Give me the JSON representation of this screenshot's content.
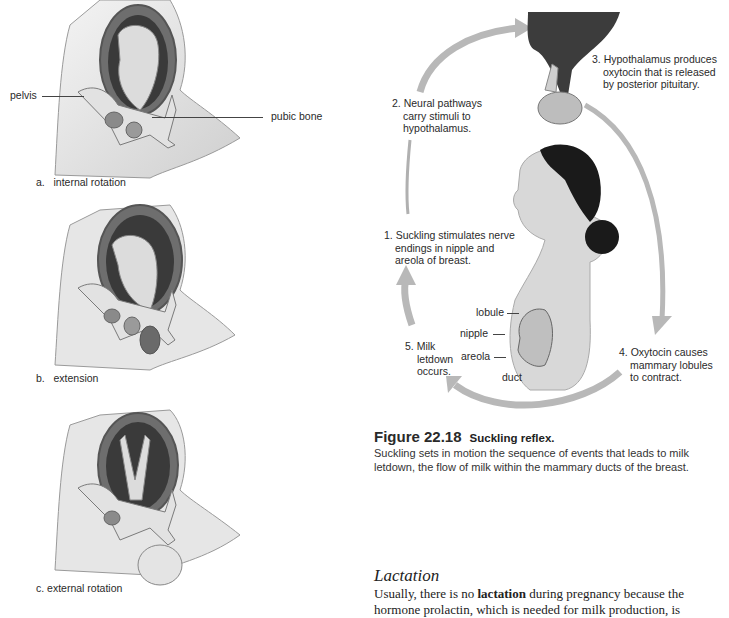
{
  "left_figure": {
    "panels": [
      {
        "id": "a",
        "caption": "a.   internal rotation",
        "labels": {
          "pelvis": "pelvis",
          "pubic_bone": "pubic bone"
        }
      },
      {
        "id": "b",
        "caption": "b.   extension"
      },
      {
        "id": "c",
        "caption": "c. external rotation"
      }
    ]
  },
  "suckling_diagram": {
    "steps": [
      {
        "num": "1.",
        "text": [
          "Suckling stimulates nerve",
          "endings in nipple and",
          "areola of breast."
        ]
      },
      {
        "num": "2.",
        "text": [
          "Neural pathways",
          "carry stimuli to",
          "hypothalamus."
        ]
      },
      {
        "num": "3.",
        "text": [
          "Hypothalamus produces",
          "oxytocin that is released",
          "by posterior pituitary."
        ]
      },
      {
        "num": "4.",
        "text": [
          "Oxytocin causes",
          "mammary lobules",
          "to contract."
        ]
      },
      {
        "num": "5.",
        "text": [
          "Milk",
          "letdown",
          "occurs."
        ]
      }
    ],
    "breast_labels": {
      "lobule": "lobule",
      "nipple": "nipple",
      "areola": "areola",
      "duct": "duct"
    },
    "colors": {
      "arrow": "#b8b8b8",
      "arrow_edge": "#8e8e8e",
      "hair": "#1a1a1a",
      "skin": "#d9d9d9"
    }
  },
  "figure_caption": {
    "number": "Figure 22.18",
    "title": "Suckling reflex.",
    "description_lines": [
      "Suckling sets in motion the sequence of events that leads to milk",
      "letdown, the flow of milk within the mammary ducts of the breast."
    ]
  },
  "section": {
    "heading": "Lactation",
    "para_before": "Usually, there is no ",
    "para_bold": "lactation",
    "para_after": " during pregnancy because the",
    "line2": "hormone prolactin, which is needed for milk production, is"
  }
}
